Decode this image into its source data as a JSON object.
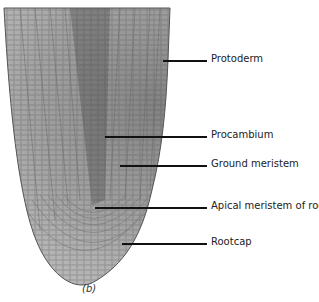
{
  "figure": {
    "caption": "(b)",
    "labels": [
      {
        "id": "protoderm",
        "text": "Protoderm",
        "y": 60,
        "line_x1": 163,
        "line_x2": 207
      },
      {
        "id": "procambium",
        "text": "Procambium",
        "y": 136,
        "line_x1": 105,
        "line_x2": 207
      },
      {
        "id": "ground-meristem",
        "text": "Ground meristem",
        "y": 165,
        "line_x1": 120,
        "line_x2": 207
      },
      {
        "id": "apical-meristem",
        "text": "Apical meristem of root",
        "y": 207,
        "line_x1": 95,
        "line_x2": 207
      },
      {
        "id": "rootcap",
        "text": "Rootcap",
        "y": 243,
        "line_x1": 122,
        "line_x2": 207
      }
    ]
  }
}
